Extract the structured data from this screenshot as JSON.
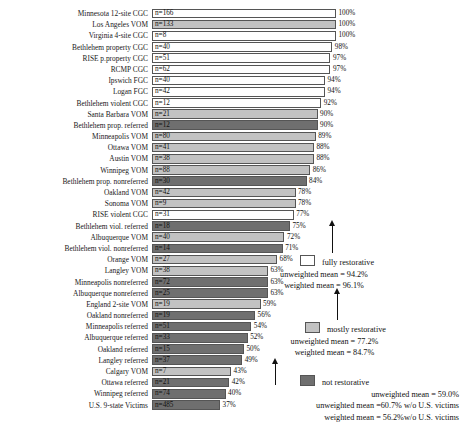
{
  "chart_data": {
    "type": "bar",
    "title": "",
    "xlabel": "",
    "ylabel": "",
    "xlim": [
      0,
      100
    ],
    "orientation": "horizontal",
    "grid": false,
    "legend_position": "right",
    "categories": [
      "Minnesota 12-site CGC",
      "Los Angeles VOM",
      "Virginia 4-site CGC",
      "Bethlehem property CGC",
      "RISE p.property CGC",
      "RCMP CGC",
      "Ipswich FGC",
      "Logan FGC",
      "Bethlehem violent CGC",
      "Santa Barbara VOM",
      "Bethlehem prop. referred",
      "Minneapolis VOM",
      "Ottawa VOM",
      "Austin VOM",
      "Winnipeg VOM",
      "Bethlehem prop. nonreferred",
      "Oakland VOM",
      "Sonoma VOM",
      "RISE violent CGC",
      "Bethlehem viol. referred",
      "Albuquerque VOM",
      "Bethlehem viol. nonreferred",
      "Orange VOM",
      "Langley VOM",
      "Minneapolis nonreferred",
      "Albuquerque nonreferred",
      "England 2-site VOM",
      "Oakland nonreferred",
      "Minneapolis referred",
      "Albuquerque referred",
      "Oakland referred",
      "Langley referred",
      "Calgary VOM",
      "Ottawa referred",
      "Winnipeg referred",
      "U.S. 9-state Victims"
    ],
    "values": [
      100,
      100,
      100,
      98,
      97,
      97,
      94,
      94,
      92,
      90,
      90,
      89,
      88,
      88,
      86,
      84,
      78,
      78,
      77,
      75,
      72,
      71,
      68,
      63,
      63,
      63,
      59,
      56,
      54,
      52,
      50,
      49,
      43,
      42,
      40,
      37
    ],
    "n_values": [
      166,
      133,
      8,
      40,
      51,
      62,
      40,
      42,
      12,
      21,
      12,
      80,
      41,
      38,
      88,
      30,
      42,
      9,
      31,
      18,
      40,
      14,
      27,
      38,
      72,
      25,
      19,
      19,
      51,
      33,
      15,
      37,
      7,
      21,
      74,
      485
    ],
    "groups": [
      "full",
      "full",
      "full",
      "full",
      "full",
      "full",
      "full",
      "full",
      "full",
      "mostly",
      "not",
      "mostly",
      "mostly",
      "mostly",
      "mostly",
      "not",
      "mostly",
      "mostly",
      "full",
      "not",
      "mostly",
      "not",
      "mostly",
      "mostly",
      "not",
      "not",
      "mostly",
      "not",
      "not",
      "not",
      "not",
      "not",
      "mostly",
      "not",
      "not",
      "not"
    ],
    "rows": [
      {
        "label": "Minnesota 12-site CGC",
        "n": "n=166",
        "pct": "100%",
        "value": 100,
        "group": "full"
      },
      {
        "label": "Los Angeles VOM",
        "n": "n=133",
        "pct": "100%",
        "value": 100,
        "group": "mostly"
      },
      {
        "label": "Virginia 4-site CGC",
        "n": "n=8",
        "pct": "100%",
        "value": 100,
        "group": "full"
      },
      {
        "label": "Bethlehem property CGC",
        "n": "n=40",
        "pct": "98%",
        "value": 98,
        "group": "full"
      },
      {
        "label": "RISE p.property CGC",
        "n": "n=51",
        "pct": "97%",
        "value": 97,
        "group": "full"
      },
      {
        "label": "RCMP CGC",
        "n": "n=62",
        "pct": "97%",
        "value": 97,
        "group": "full"
      },
      {
        "label": "Ipswich FGC",
        "n": "n=40",
        "pct": "94%",
        "value": 94,
        "group": "full"
      },
      {
        "label": "Logan FGC",
        "n": "n=42",
        "pct": "94%",
        "value": 94,
        "group": "full"
      },
      {
        "label": "Bethlehem violent CGC",
        "n": "n=12",
        "pct": "92%",
        "value": 92,
        "group": "full"
      },
      {
        "label": "Santa Barbara VOM",
        "n": "n=21",
        "pct": "90%",
        "value": 90,
        "group": "mostly"
      },
      {
        "label": "Bethlehem prop. referred",
        "n": "n=12",
        "pct": "90%",
        "value": 90,
        "group": "not"
      },
      {
        "label": "Minneapolis VOM",
        "n": "n=80",
        "pct": "89%",
        "value": 89,
        "group": "mostly"
      },
      {
        "label": "Ottawa VOM",
        "n": "n=41",
        "pct": "88%",
        "value": 88,
        "group": "mostly"
      },
      {
        "label": "Austin VOM",
        "n": "n=38",
        "pct": "88%",
        "value": 88,
        "group": "mostly"
      },
      {
        "label": "Winnipeg VOM",
        "n": "n=88",
        "pct": "86%",
        "value": 86,
        "group": "mostly"
      },
      {
        "label": "Bethlehem prop. nonreferred",
        "n": "n=30",
        "pct": "84%",
        "value": 84,
        "group": "not"
      },
      {
        "label": "Oakland VOM",
        "n": "n=42",
        "pct": "78%",
        "value": 78,
        "group": "mostly"
      },
      {
        "label": "Sonoma VOM",
        "n": "n=9",
        "pct": "78%",
        "value": 78,
        "group": "mostly"
      },
      {
        "label": "RISE violent CGC",
        "n": "n=31",
        "pct": "77%",
        "value": 77,
        "group": "full"
      },
      {
        "label": "Bethlehem viol. referred",
        "n": "n=18",
        "pct": "75%",
        "value": 75,
        "group": "not"
      },
      {
        "label": "Albuquerque VOM",
        "n": "n=40",
        "pct": "72%",
        "value": 72,
        "group": "mostly"
      },
      {
        "label": "Bethlehem viol. nonreferred",
        "n": "n=14",
        "pct": "71%",
        "value": 71,
        "group": "not"
      },
      {
        "label": "Orange VOM",
        "n": "n=27",
        "pct": "68%",
        "value": 68,
        "group": "mostly"
      },
      {
        "label": "Langley VOM",
        "n": "n=38",
        "pct": "63%",
        "value": 63,
        "group": "mostly"
      },
      {
        "label": "Minneapolis nonreferred",
        "n": "n=72",
        "pct": "63%",
        "value": 63,
        "group": "not"
      },
      {
        "label": "Albuquerque nonreferred",
        "n": "n=25",
        "pct": "63%",
        "value": 63,
        "group": "not"
      },
      {
        "label": "England 2-site VOM",
        "n": "n=19",
        "pct": "59%",
        "value": 59,
        "group": "mostly"
      },
      {
        "label": "Oakland nonreferred",
        "n": "n=19",
        "pct": "56%",
        "value": 56,
        "group": "not"
      },
      {
        "label": "Minneapolis referred",
        "n": "n=51",
        "pct": "54%",
        "value": 54,
        "group": "not"
      },
      {
        "label": "Albuquerque referred",
        "n": "n=33",
        "pct": "52%",
        "value": 52,
        "group": "not"
      },
      {
        "label": "Oakland referred",
        "n": "n=15",
        "pct": "50%",
        "value": 50,
        "group": "not"
      },
      {
        "label": "Langley referred",
        "n": "n=37",
        "pct": "49%",
        "value": 49,
        "group": "not"
      },
      {
        "label": "Calgary VOM",
        "n": "n=7",
        "pct": "43%",
        "value": 43,
        "group": "mostly"
      },
      {
        "label": "Ottawa referred",
        "n": "n=21",
        "pct": "42%",
        "value": 42,
        "group": "not"
      },
      {
        "label": "Winnipeg referred",
        "n": "n=74",
        "pct": "40%",
        "value": 40,
        "group": "not"
      },
      {
        "label": "U.S. 9-state Victims",
        "n": "n=485",
        "pct": "37%",
        "value": 37,
        "group": "not"
      }
    ],
    "legend": [
      {
        "key": "full",
        "title": "fully restorative",
        "lines": [
          "unweighted mean = 94.2%",
          "weighted mean = 96.1%"
        ]
      },
      {
        "key": "mostly",
        "title": "mostly restorative",
        "lines": [
          "unweighted mean = 77.2%",
          "weighted mean = 84.7%"
        ]
      },
      {
        "key": "not",
        "title": "not restorative",
        "lines": [
          "unweighted mean = 59.0%",
          "unweighted mean =60.7% w/o U.S. victims",
          "weighted mean =   56.2%w/o U.S. victims"
        ]
      }
    ],
    "colors": {
      "fully_restorative": "#ffffff",
      "mostly_restorative": "#c2c2c2",
      "not_restorative": "#6f6f6f",
      "bar_border": "#555555",
      "text": "#111111"
    }
  }
}
